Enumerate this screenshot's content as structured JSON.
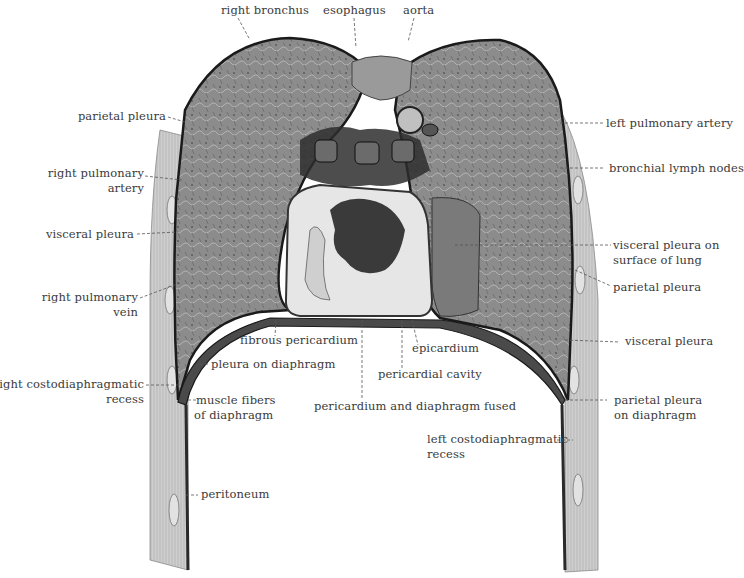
{
  "figure": {
    "colors": {
      "background": "#ffffff",
      "label_text": "#3a3a3a",
      "leader_line": "#555555",
      "lung_tissue": "#8a8a8a",
      "lung_dark": "#5a5a5a",
      "pleura_line": "#1a1a1a",
      "heart_light": "#e8e8e8",
      "heart_dark": "#3a3a3a",
      "body_wall": "#c8c8c8"
    }
  },
  "labels": {
    "top": [
      {
        "id": "right-bronchus",
        "text": "right bronchus"
      },
      {
        "id": "esophagus",
        "text": "esophagus"
      },
      {
        "id": "aorta",
        "text": "aorta"
      }
    ],
    "left": [
      {
        "id": "parietal-pleura-left",
        "lines": [
          "parietal pleura"
        ]
      },
      {
        "id": "right-pulmonary-artery",
        "lines": [
          "right pulmonary",
          "artery"
        ]
      },
      {
        "id": "visceral-pleura-left",
        "lines": [
          "visceral pleura"
        ]
      },
      {
        "id": "right-pulmonary-vein",
        "lines": [
          "right pulmonary",
          "vein"
        ]
      },
      {
        "id": "right-costodiaphragmatic-recess",
        "lines": [
          "right costodiaphragmatic",
          "recess"
        ]
      }
    ],
    "right": [
      {
        "id": "left-pulmonary-artery",
        "lines": [
          "left pulmonary artery"
        ]
      },
      {
        "id": "bronchial-lymph-nodes",
        "lines": [
          "bronchial lymph nodes"
        ]
      },
      {
        "id": "visceral-pleura-on-surface-of-lung",
        "lines": [
          "visceral pleura on",
          "surface of lung"
        ]
      },
      {
        "id": "parietal-pleura-right",
        "lines": [
          "parietal pleura"
        ]
      },
      {
        "id": "visceral-pleura-right",
        "lines": [
          "visceral pleura"
        ]
      },
      {
        "id": "parietal-pleura-on-diaphragm",
        "lines": [
          "parietal pleura",
          "on diaphragm"
        ]
      }
    ],
    "center": [
      {
        "id": "fibrous-pericardium",
        "lines": [
          "fibrous pericardium"
        ]
      },
      {
        "id": "epicardium",
        "lines": [
          "epicardium"
        ]
      },
      {
        "id": "pleura-on-diaphragm",
        "lines": [
          "pleura on diaphragm"
        ]
      },
      {
        "id": "pericardial-cavity",
        "lines": [
          "pericardial cavity"
        ]
      },
      {
        "id": "muscle-fibers-of-diaphragm",
        "lines": [
          "muscle fibers",
          "of diaphragm"
        ]
      },
      {
        "id": "pericardium-and-diaphragm-fused",
        "lines": [
          "pericardium and diaphragm fused"
        ]
      },
      {
        "id": "left-costodiaphragmatic-recess",
        "lines": [
          "left costodiaphragmatic",
          "recess"
        ]
      },
      {
        "id": "peritoneum",
        "lines": [
          "peritoneum"
        ]
      }
    ]
  }
}
